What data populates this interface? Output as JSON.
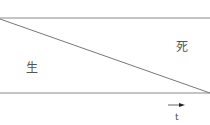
{
  "diagram": {
    "region_labels": {
      "life": "生",
      "death": "死"
    },
    "axis_label": "t",
    "arrow": "time-arrow",
    "colors": {
      "line": "#8a8a8a",
      "text": "#555555"
    }
  }
}
